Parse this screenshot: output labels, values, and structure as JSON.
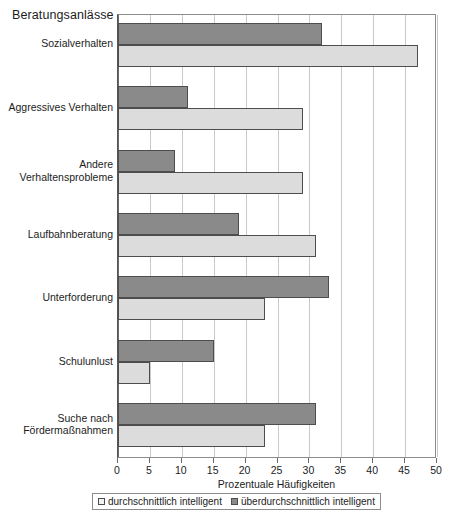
{
  "chart_data": {
    "type": "bar",
    "orientation": "horizontal",
    "title": "",
    "xlabel": "Prozentuale Häufigkeiten",
    "ylabel": "Beratungsanlässe",
    "xlim": [
      0,
      50
    ],
    "xticks": [
      0,
      5,
      10,
      15,
      20,
      25,
      30,
      35,
      40,
      45,
      50
    ],
    "xtick_labels": [
      "0",
      "5",
      "10",
      "15",
      "20",
      "25",
      "30",
      "35",
      "40",
      "45",
      "50"
    ],
    "grid": true,
    "grid_axis": "x",
    "legend_position": "bottom",
    "categories": [
      "Sozialverhalten",
      "Aggressives Verhalten",
      "Andere\nVerhaltensprobleme",
      "Laufbahnberatung",
      "Unterforderung",
      "Schulunlust",
      "Suche nach\nFördermaßnahmen"
    ],
    "series": [
      {
        "name": "überdurchschnittlich intelligent",
        "color": "#8a8a8a",
        "values": [
          32,
          11,
          9,
          19,
          33,
          15,
          31
        ]
      },
      {
        "name": "durchschnittlich intelligent",
        "color": "#dcdcdc",
        "values": [
          47,
          29,
          29,
          31,
          23,
          5,
          23
        ]
      }
    ]
  },
  "legend": {
    "entries": [
      {
        "label": "durchschnittlich intelligent",
        "swatch": "light"
      },
      {
        "label": "überdurchschnittlich intelligent",
        "swatch": "dark"
      }
    ]
  },
  "axis": {
    "y_title": "Beratungsanlässe",
    "x_title": "Prozentuale Häufigkeiten"
  }
}
